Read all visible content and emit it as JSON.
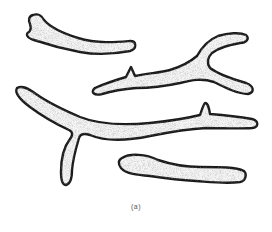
{
  "figure": {
    "caption": "(a)",
    "colors": {
      "outline": "#1a1a1a",
      "stipple": "#6a6a6a",
      "background": "#ffffff"
    },
    "shapes": [
      {
        "name": "top-left-club-fragment"
      },
      {
        "name": "upper-right-branched-fragment"
      },
      {
        "name": "long-branched-fragment"
      },
      {
        "name": "lower-right-dumbbell-fragment"
      }
    ]
  }
}
